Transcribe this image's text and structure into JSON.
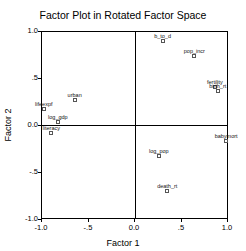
{
  "chart_data": {
    "type": "scatter",
    "title": "Factor Plot in Rotated Factor Space",
    "xlabel": "Factor 1",
    "ylabel": "Factor 2",
    "xlim": [
      -1.0,
      1.0
    ],
    "ylim": [
      -1.0,
      1.0
    ],
    "x_ticks": [
      "-1.0",
      "-.5",
      "0.0",
      ".5",
      "1.0"
    ],
    "y_ticks": [
      "1.0",
      ".5",
      "0.0",
      "-.5",
      "-1.0"
    ],
    "grid": false,
    "reference_lines": {
      "x": 0,
      "y": 0
    },
    "points": [
      {
        "label": "b_to_d",
        "x": 0.3,
        "y": 0.89
      },
      {
        "label": "pop_incr",
        "x": 0.64,
        "y": 0.73
      },
      {
        "label": "fertility",
        "x": 0.86,
        "y": 0.4
      },
      {
        "label": "birth_rt",
        "x": 0.89,
        "y": 0.36
      },
      {
        "label": "urban",
        "x": -0.64,
        "y": 0.27
      },
      {
        "label": "lifeexpf",
        "x": -0.97,
        "y": 0.17
      },
      {
        "label": "log_gdp",
        "x": -0.82,
        "y": 0.03
      },
      {
        "label": "literacy",
        "x": -0.89,
        "y": -0.09
      },
      {
        "label": "babymort",
        "x": 0.98,
        "y": -0.17
      },
      {
        "label": "log_pop",
        "x": 0.26,
        "y": -0.33
      },
      {
        "label": "death_rt",
        "x": 0.35,
        "y": -0.7
      }
    ]
  }
}
